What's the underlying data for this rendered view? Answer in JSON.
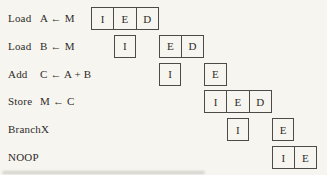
{
  "diagram": {
    "colors": {
      "background": "#f7f5f0",
      "box_border": "#4d4b47",
      "text": "#2e2c29"
    },
    "stage_letters_legend": [
      "I",
      "E",
      "D"
    ],
    "rows": [
      {
        "op": "Load",
        "operand": "A ← M",
        "groups": [
          {
            "start": 1,
            "cells": [
              "I",
              "E",
              "D"
            ]
          }
        ]
      },
      {
        "op": "Load",
        "operand": "B ← M",
        "groups": [
          {
            "start": 2,
            "cells": [
              "I"
            ]
          },
          {
            "start": 4,
            "cells": [
              "E",
              "D"
            ]
          }
        ]
      },
      {
        "op": "Add",
        "operand": "C ← A + B",
        "groups": [
          {
            "start": 4,
            "cells": [
              "I"
            ]
          },
          {
            "start": 6,
            "cells": [
              "E"
            ]
          }
        ]
      },
      {
        "op": "Store",
        "operand": "M ← C",
        "groups": [
          {
            "start": 6,
            "cells": [
              "I",
              "E",
              "D"
            ]
          }
        ]
      },
      {
        "op": "Branch",
        "operand": "X",
        "groups": [
          {
            "start": 7,
            "cells": [
              "I"
            ]
          },
          {
            "start": 9,
            "cells": [
              "E"
            ]
          }
        ]
      },
      {
        "op": "NOOP",
        "operand": "",
        "groups": [
          {
            "start": 9,
            "cells": [
              "I",
              "E"
            ]
          }
        ]
      }
    ]
  }
}
